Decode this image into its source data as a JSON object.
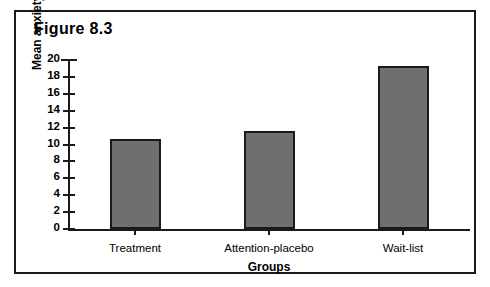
{
  "figure": {
    "title": "Figure 8.3",
    "frame_color": "#1a1a1a",
    "background": "#ffffff"
  },
  "chart_data": {
    "type": "bar",
    "title": "Figure 8.3",
    "categories": [
      "Treatment",
      "Attention-placebo",
      "Wait-list"
    ],
    "values": [
      10.6,
      11.6,
      19.3
    ],
    "xlabel": "Groups",
    "ylabel": "Mean anxiety score",
    "ylim": [
      0,
      20
    ],
    "ytick_step": 2,
    "yticks": [
      0,
      2,
      4,
      6,
      8,
      10,
      12,
      14,
      16,
      18,
      20
    ],
    "ytick_labels": [
      "0",
      "2",
      "4",
      "6",
      "8",
      "10",
      "12",
      "14",
      "16",
      "18",
      "20"
    ],
    "grid": false,
    "legend": false,
    "bar_fill_color": "#6f6f6f",
    "bar_edge_color": "#1a1a1a",
    "axis_color": "#1a1a1a"
  }
}
